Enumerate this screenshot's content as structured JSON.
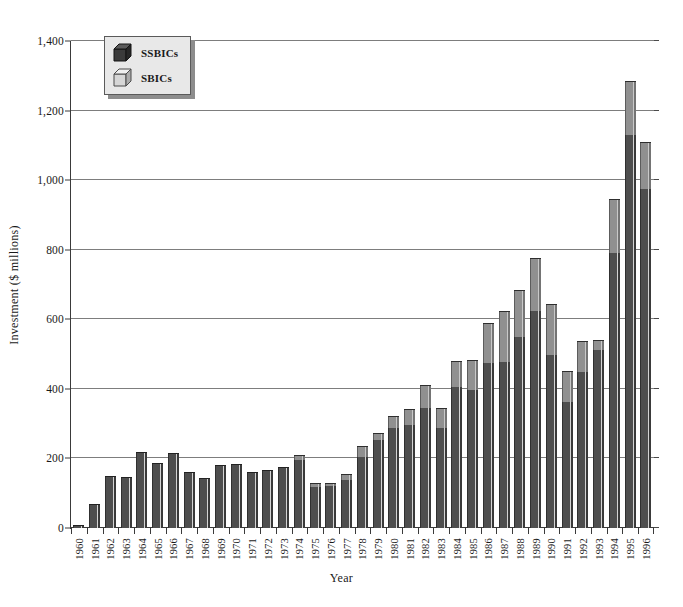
{
  "chart_data": {
    "type": "bar",
    "stacked": true,
    "title": "",
    "xlabel": "Year",
    "ylabel": "Investment ($ millions)",
    "ylim": [
      0,
      1400
    ],
    "ytick_values": [
      0,
      200,
      400,
      600,
      800,
      1000,
      1200,
      1400
    ],
    "ytick_labels": [
      "0",
      "200",
      "400",
      "600",
      "800",
      "1,000",
      "1,200",
      "1,400"
    ],
    "grid": true,
    "legend_position": "top-left",
    "categories": [
      "1960",
      "1961",
      "1962",
      "1963",
      "1964",
      "1965",
      "1966",
      "1967",
      "1968",
      "1969",
      "1970",
      "1971",
      "1972",
      "1973",
      "1974",
      "1975",
      "1976",
      "1977",
      "1978",
      "1979",
      "1980",
      "1981",
      "1982",
      "1983",
      "1984",
      "1985",
      "1986",
      "1987",
      "1988",
      "1989",
      "1990",
      "1991",
      "1992",
      "1993",
      "1994",
      "1995",
      "1996"
    ],
    "series": [
      {
        "name": "SSBICs",
        "color": "#4e4e4e",
        "values": [
          10,
          70,
          150,
          148,
          218,
          186,
          215,
          160,
          145,
          182,
          183,
          160,
          168,
          175,
          196,
          118,
          122,
          138,
          205,
          253,
          288,
          295,
          345,
          288,
          405,
          398,
          475,
          478,
          548,
          625,
          497,
          362,
          448,
          512,
          790,
          1130,
          975
        ]
      },
      {
        "name": "SBICs",
        "color": "#909090",
        "values": [
          0,
          0,
          0,
          0,
          0,
          0,
          0,
          0,
          0,
          0,
          0,
          0,
          0,
          0,
          15,
          10,
          8,
          17,
          30,
          20,
          35,
          48,
          65,
          58,
          75,
          85,
          115,
          145,
          137,
          150,
          148,
          88,
          90,
          28,
          155,
          155,
          135
        ]
      }
    ],
    "totals": [
      10,
      70,
      150,
      148,
      218,
      186,
      215,
      160,
      145,
      182,
      183,
      160,
      168,
      175,
      211,
      128,
      130,
      155,
      235,
      273,
      323,
      343,
      410,
      346,
      480,
      483,
      590,
      623,
      685,
      775,
      645,
      450,
      538,
      540,
      945,
      1285,
      1110
    ]
  },
  "legend": {
    "items": [
      {
        "label": "SSBICs",
        "swatch": "cube-dark-icon"
      },
      {
        "label": "SBICs",
        "swatch": "cube-light-icon"
      }
    ]
  },
  "axes": {
    "x_title": "Year",
    "y_title": "Investment ($ millions)"
  }
}
